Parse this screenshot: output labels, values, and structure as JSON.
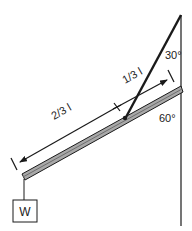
{
  "diagram": {
    "title": "",
    "labels": {
      "angle_top": "30°",
      "angle_beam": "60°",
      "segment_short": "1/3 l",
      "segment_long": "2/3 l",
      "weight": "W"
    },
    "colors": {
      "line": "#1a1a1a",
      "beam_fill": "#a8a8a8",
      "beam_edge": "#1a1a1a",
      "background": "#ffffff"
    },
    "elements": [
      {
        "id": "wall",
        "type": "vertical-line"
      },
      {
        "id": "cable",
        "type": "line",
        "from": "wall-top",
        "to": "beam-attachment"
      },
      {
        "id": "beam",
        "type": "bar",
        "from": "weight-end",
        "to": "wall"
      },
      {
        "id": "dimension-arrow",
        "type": "double-arrow",
        "segments": [
          "2/3 l",
          "1/3 l"
        ]
      },
      {
        "id": "center-mark",
        "type": "x-marker"
      },
      {
        "id": "weight",
        "type": "box",
        "label": "W"
      }
    ]
  }
}
